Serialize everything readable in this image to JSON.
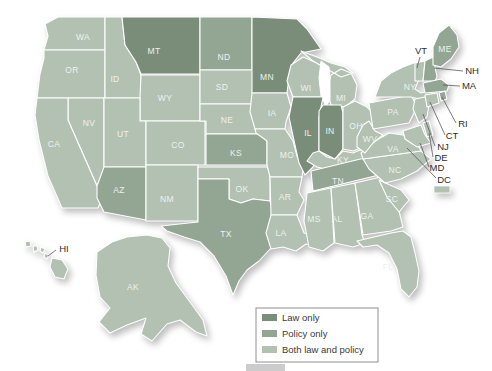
{
  "figure": {
    "width": 492,
    "height": 371,
    "background": "#ffffff"
  },
  "legend": {
    "items": [
      {
        "id": "law",
        "label": "Law only",
        "color": "#798d79"
      },
      {
        "id": "policy",
        "label": "Policy only",
        "color": "#93a593"
      },
      {
        "id": "both",
        "label": "Both law and policy",
        "color": "#b2c1b2"
      }
    ]
  },
  "map": {
    "border_color": "#ffffff",
    "state_label_color": "#edf2ed",
    "callout_label_color": "#2e2e2e",
    "states": {
      "WA": {
        "label": "WA",
        "category": "both"
      },
      "OR": {
        "label": "OR",
        "category": "both"
      },
      "CA": {
        "label": "CA",
        "category": "both"
      },
      "NV": {
        "label": "NV",
        "category": "both"
      },
      "ID": {
        "label": "ID",
        "category": "both"
      },
      "MT": {
        "label": "MT",
        "category": "law"
      },
      "WY": {
        "label": "WY",
        "category": "both"
      },
      "UT": {
        "label": "UT",
        "category": "both"
      },
      "CO": {
        "label": "CO",
        "category": "both"
      },
      "AZ": {
        "label": "AZ",
        "category": "policy"
      },
      "NM": {
        "label": "NM",
        "category": "both"
      },
      "ND": {
        "label": "ND",
        "category": "policy"
      },
      "SD": {
        "label": "SD",
        "category": "both"
      },
      "NE": {
        "label": "NE",
        "category": "both"
      },
      "KS": {
        "label": "KS",
        "category": "policy"
      },
      "OK": {
        "label": "OK",
        "category": "both"
      },
      "TX": {
        "label": "TX",
        "category": "policy"
      },
      "MN": {
        "label": "MN",
        "category": "law"
      },
      "IA": {
        "label": "IA",
        "category": "both"
      },
      "MO": {
        "label": "MO",
        "category": "both"
      },
      "AR": {
        "label": "AR",
        "category": "both"
      },
      "LA": {
        "label": "LA",
        "category": "both"
      },
      "WI": {
        "label": "WI",
        "category": "both"
      },
      "MI": {
        "label": "MI",
        "category": "both"
      },
      "IL": {
        "label": "IL",
        "category": "law"
      },
      "IN": {
        "label": "IN",
        "category": "law"
      },
      "OH": {
        "label": "OH",
        "category": "both"
      },
      "KY": {
        "label": "KY",
        "category": "both"
      },
      "TN": {
        "label": "TN",
        "category": "policy"
      },
      "MS": {
        "label": "MS",
        "category": "both"
      },
      "AL": {
        "label": "AL",
        "category": "both"
      },
      "GA": {
        "label": "GA",
        "category": "both"
      },
      "FL": {
        "label": "FL",
        "category": "both"
      },
      "SC": {
        "label": "SC",
        "category": "both"
      },
      "NC": {
        "label": "NC",
        "category": "both"
      },
      "VA": {
        "label": "VA",
        "category": "both"
      },
      "WV": {
        "label": "WV",
        "category": "both"
      },
      "PA": {
        "label": "PA",
        "category": "both"
      },
      "NY": {
        "label": "NY",
        "category": "both"
      },
      "NJ": {
        "label": "NJ",
        "category": "both"
      },
      "VT": {
        "label": "VT",
        "category": "both"
      },
      "NH": {
        "label": "NH",
        "category": "policy"
      },
      "MA": {
        "label": "MA",
        "category": "policy"
      },
      "RI": {
        "label": "RI",
        "category": "policy"
      },
      "CT": {
        "label": "CT",
        "category": "both"
      },
      "DE": {
        "label": "DE",
        "category": "both"
      },
      "MD": {
        "label": "MD",
        "category": "both"
      },
      "ME": {
        "label": "ME",
        "category": "policy"
      },
      "DC": {
        "label": "DC",
        "category": "both"
      },
      "AK": {
        "label": "AK",
        "category": "both"
      },
      "HI": {
        "label": "HI",
        "category": "both"
      }
    }
  },
  "decor": {
    "bottom_bar_color": "#cccccc"
  }
}
